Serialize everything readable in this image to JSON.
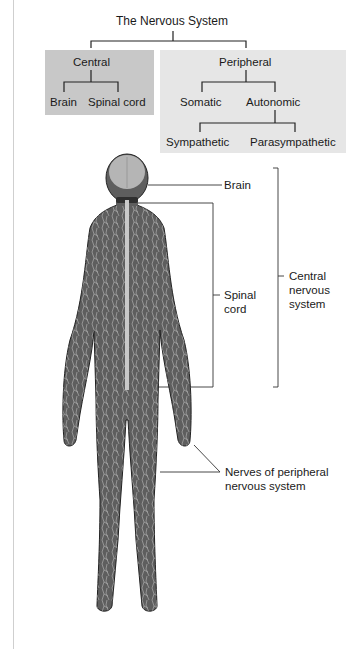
{
  "hierarchy": {
    "root": "The Nervous System",
    "central": {
      "label": "Central",
      "children": [
        "Brain",
        "Spinal cord"
      ]
    },
    "peripheral": {
      "label": "Peripheral",
      "children": [
        "Somatic",
        "Autonomic"
      ],
      "autonomic_children": [
        "Sympathetic",
        "Parasympathetic"
      ]
    }
  },
  "figure_labels": {
    "brain": "Brain",
    "spinal_cord_line1": "Spinal",
    "spinal_cord_line2": "cord",
    "cns_line1": "Central",
    "cns_line2": "nervous",
    "cns_line3": "system",
    "pns_line1": "Nerves of peripheral",
    "pns_line2": "nervous system"
  },
  "colors": {
    "central_box": "#c8c8c8",
    "peripheral_box": "#e6e6e6",
    "body": "#5e5e5e",
    "nerves": "#d8d8d8"
  }
}
